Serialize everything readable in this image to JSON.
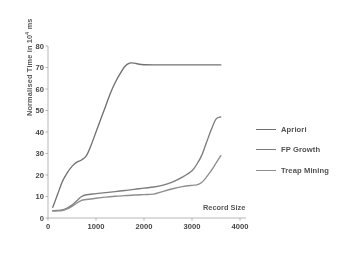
{
  "chart_data": {
    "type": "line",
    "title": "",
    "xlabel": "Record Size",
    "ylabel": "Normalised Time in 10^4 ms",
    "ylabel_prefix": "Normalised Time in 10",
    "ylabel_exponent": "4",
    "ylabel_suffix": " ms",
    "xlim": [
      0,
      4000
    ],
    "ylim": [
      0,
      80
    ],
    "xticks": [
      0,
      1000,
      2000,
      3000,
      4000
    ],
    "yticks": [
      0,
      10,
      20,
      30,
      40,
      50,
      60,
      70,
      80
    ],
    "xtick_labels": [
      "0",
      "1000",
      "2000",
      "3000",
      "4000"
    ],
    "ytick_labels": [
      "0",
      "10",
      "20",
      "30",
      "40",
      "50",
      "60",
      "70",
      "80"
    ],
    "grid": false,
    "legend_position": "right",
    "series": [
      {
        "name": "Apriori",
        "color": "#6e6e6e",
        "x": [
          100,
          200,
          300,
          400,
          500,
          600,
          700,
          800,
          900,
          1000,
          1100,
          1200,
          1300,
          1400,
          1500,
          1600,
          1700,
          1800,
          1900,
          2000,
          2200,
          2400,
          2600,
          2800,
          3000,
          3200,
          3400,
          3600
        ],
        "y": [
          5,
          11,
          17,
          21,
          24,
          26,
          27,
          29,
          34,
          40,
          46,
          52,
          58,
          63,
          67,
          70.5,
          72,
          72,
          71.5,
          71.3,
          71.2,
          71.2,
          71.2,
          71.2,
          71.2,
          71.2,
          71.2,
          71.2
        ]
      },
      {
        "name": "FP Growth",
        "color": "#7a7a7a",
        "x": [
          100,
          200,
          300,
          400,
          500,
          600,
          700,
          800,
          1000,
          1200,
          1400,
          1600,
          1800,
          2000,
          2200,
          2400,
          2600,
          2800,
          3000,
          3100,
          3200,
          3300,
          3400,
          3500,
          3600
        ],
        "y": [
          3.4,
          3.5,
          3.8,
          4.6,
          6,
          8,
          10,
          10.8,
          11.3,
          11.8,
          12.3,
          12.8,
          13.3,
          13.9,
          14.4,
          15.3,
          16.8,
          19,
          22,
          25,
          29,
          35,
          41,
          46,
          47
        ]
      },
      {
        "name": "Treap Mining",
        "color": "#8c8c8c",
        "x": [
          100,
          200,
          300,
          400,
          500,
          600,
          700,
          800,
          1000,
          1200,
          1400,
          1600,
          1800,
          2000,
          2200,
          2400,
          2600,
          2800,
          3000,
          3100,
          3200,
          3300,
          3400,
          3500,
          3600
        ],
        "y": [
          3.2,
          3.3,
          3.5,
          4.2,
          5.4,
          7,
          8.2,
          8.6,
          9.2,
          9.7,
          10.1,
          10.4,
          10.7,
          10.9,
          11.1,
          12.4,
          13.6,
          14.6,
          15.2,
          15.4,
          16.5,
          19,
          22,
          25.5,
          29
        ]
      }
    ],
    "legend": [
      {
        "label": "Apriori",
        "style": "solid"
      },
      {
        "label": "FP Growth",
        "style": "solid"
      },
      {
        "label": "Treap Mining",
        "style": "solid"
      }
    ]
  },
  "axes_geometry": {
    "plot_left": 48,
    "plot_right": 240,
    "plot_top": 46,
    "plot_bottom": 218
  },
  "colors": {
    "axis": "#9a9a9a",
    "text": "#4a4a4a",
    "background": "#ffffff"
  }
}
